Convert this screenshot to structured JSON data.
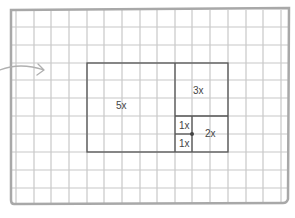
{
  "diagram": {
    "colors": {
      "grid_line": "#c8c8c8",
      "border": "#a8a8a8",
      "rect_line": "#555555",
      "arrow": "#b0b0b0",
      "text": "#444444",
      "dot": "#444444"
    },
    "grid": {
      "columns_x": [
        16,
        34,
        51,
        69,
        87,
        104,
        122,
        140,
        157,
        175,
        192,
        210,
        228,
        246,
        263,
        281
      ],
      "rows_y": [
        27,
        45,
        63,
        80,
        98,
        116,
        134,
        152,
        170,
        188
      ]
    },
    "regions": [
      {
        "label": "5x",
        "x": 116,
        "y": 101
      },
      {
        "label": "3x",
        "x": 193,
        "y": 86
      },
      {
        "label": "1x",
        "x": 179,
        "y": 121
      },
      {
        "label": "2x",
        "x": 205,
        "y": 129
      },
      {
        "label": "1x",
        "x": 179,
        "y": 139
      }
    ]
  }
}
